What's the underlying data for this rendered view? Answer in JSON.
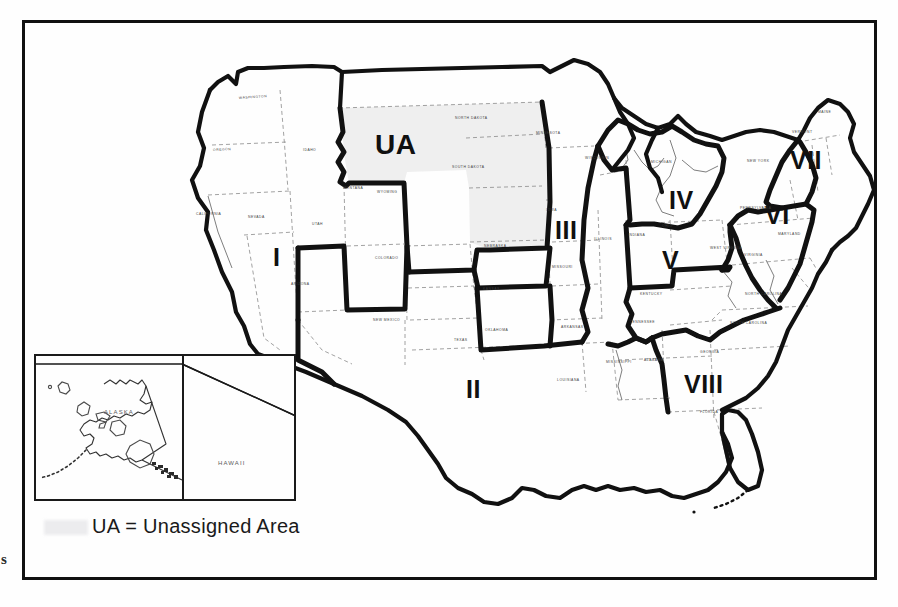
{
  "document": {
    "type": "map",
    "title": "United States Regional Assignment Map",
    "margin_artifact": "s"
  },
  "legend": {
    "abbreviation": "UA",
    "equals": "=",
    "meaning": "Unassigned Area",
    "full_text": "UA = Unassigned Area"
  },
  "regions": [
    {
      "id": "region-1",
      "label": "I",
      "x": 273,
      "y": 245,
      "font_size": 25,
      "area": "West / Pacific"
    },
    {
      "id": "region-2",
      "label": "II",
      "x": 466,
      "y": 377,
      "font_size": 25,
      "area": "South Central"
    },
    {
      "id": "region-3",
      "label": "III",
      "x": 555,
      "y": 218,
      "font_size": 25,
      "area": "Midwest / Iowa-Missouri"
    },
    {
      "id": "region-4",
      "label": "IV",
      "x": 669,
      "y": 188,
      "font_size": 25,
      "area": "Great Lakes / Michigan"
    },
    {
      "id": "region-5",
      "label": "V",
      "x": 662,
      "y": 248,
      "font_size": 25,
      "area": "Ohio Valley"
    },
    {
      "id": "region-6",
      "label": "VI",
      "x": 765,
      "y": 203,
      "font_size": 25,
      "area": "Mid-Atlantic"
    },
    {
      "id": "region-7",
      "label": "VII",
      "x": 790,
      "y": 148,
      "font_size": 25,
      "area": "New England"
    },
    {
      "id": "region-8",
      "label": "VIII",
      "x": 684,
      "y": 372,
      "font_size": 25,
      "area": "Southeast"
    },
    {
      "id": "region-ua",
      "label": "UA",
      "x": 375,
      "y": 131,
      "font_size": 28,
      "area": "Northern Plains (Unassigned)"
    }
  ],
  "inset": {
    "alaska_label": "ALASKA",
    "hawaii_label": "HAWAII"
  },
  "state_names": [
    {
      "name": "WASHINGTON",
      "x": 239,
      "y": 96,
      "rot": -4
    },
    {
      "name": "OREGON",
      "x": 213,
      "y": 148,
      "rot": -3
    },
    {
      "name": "CALIFORNIA",
      "x": 196,
      "y": 212,
      "rot": 0
    },
    {
      "name": "NEVADA",
      "x": 248,
      "y": 215,
      "rot": 0
    },
    {
      "name": "IDAHO",
      "x": 303,
      "y": 148,
      "rot": 0
    },
    {
      "name": "MONTANA",
      "x": 343,
      "y": 186,
      "rot": 0
    },
    {
      "name": "WYOMING",
      "x": 377,
      "y": 190,
      "rot": 0
    },
    {
      "name": "UTAH",
      "x": 312,
      "y": 222,
      "rot": 0
    },
    {
      "name": "ARIZONA",
      "x": 291,
      "y": 282,
      "rot": 0
    },
    {
      "name": "COLORADO",
      "x": 375,
      "y": 256,
      "rot": 0
    },
    {
      "name": "NEW MEXICO",
      "x": 373,
      "y": 318,
      "rot": 0
    },
    {
      "name": "TEXAS",
      "x": 454,
      "y": 338,
      "rot": 0
    },
    {
      "name": "OKLAHOMA",
      "x": 485,
      "y": 328,
      "rot": 0
    },
    {
      "name": "KANSAS",
      "x": 483,
      "y": 287,
      "rot": 0
    },
    {
      "name": "NEBRASKA",
      "x": 484,
      "y": 244,
      "rot": 0
    },
    {
      "name": "SOUTH DAKOTA",
      "x": 452,
      "y": 165,
      "rot": 0
    },
    {
      "name": "NORTH DAKOTA",
      "x": 455,
      "y": 116,
      "rot": 0
    },
    {
      "name": "MINNESOTA",
      "x": 536,
      "y": 131,
      "rot": 0
    },
    {
      "name": "IOWA",
      "x": 546,
      "y": 208,
      "rot": 0
    },
    {
      "name": "MISSOURI",
      "x": 552,
      "y": 265,
      "rot": 0
    },
    {
      "name": "ARKANSAS",
      "x": 561,
      "y": 325,
      "rot": 0
    },
    {
      "name": "LOUISIANA",
      "x": 557,
      "y": 378,
      "rot": 0
    },
    {
      "name": "MISSISSIPPI",
      "x": 606,
      "y": 360,
      "rot": 0
    },
    {
      "name": "ALABAMA",
      "x": 644,
      "y": 358,
      "rot": 0
    },
    {
      "name": "TENNESSEE",
      "x": 630,
      "y": 320,
      "rot": 0
    },
    {
      "name": "KENTUCKY",
      "x": 640,
      "y": 292,
      "rot": 0
    },
    {
      "name": "ILLINOIS",
      "x": 594,
      "y": 237,
      "rot": 0
    },
    {
      "name": "INDIANA",
      "x": 628,
      "y": 233,
      "rot": 0
    },
    {
      "name": "OHIO",
      "x": 662,
      "y": 224,
      "rot": 0
    },
    {
      "name": "MICHIGAN",
      "x": 651,
      "y": 160,
      "rot": 0
    },
    {
      "name": "WISCONSIN",
      "x": 585,
      "y": 156,
      "rot": 0
    },
    {
      "name": "NEW YORK",
      "x": 747,
      "y": 159,
      "rot": 0
    },
    {
      "name": "PENNSYLVANIA",
      "x": 740,
      "y": 206,
      "rot": 0
    },
    {
      "name": "VIRGINIA",
      "x": 744,
      "y": 253,
      "rot": 0
    },
    {
      "name": "WEST VIRGINIA",
      "x": 710,
      "y": 246,
      "rot": 0
    },
    {
      "name": "NORTH CAROLINA",
      "x": 745,
      "y": 292,
      "rot": 0
    },
    {
      "name": "SOUTH CAROLINA",
      "x": 730,
      "y": 321,
      "rot": 0
    },
    {
      "name": "GEORGIA",
      "x": 700,
      "y": 350,
      "rot": 0
    },
    {
      "name": "FLORIDA",
      "x": 700,
      "y": 410,
      "rot": 0
    },
    {
      "name": "MAINE",
      "x": 818,
      "y": 110,
      "rot": 0
    },
    {
      "name": "VERMONT",
      "x": 792,
      "y": 130,
      "rot": 0
    },
    {
      "name": "MARYLAND",
      "x": 778,
      "y": 232,
      "rot": 0
    }
  ],
  "colors": {
    "unassigned_fill": "#efefef",
    "region_border": "#111111",
    "state_border": "#777777",
    "frame": "#111111",
    "background": "#fefefe"
  }
}
